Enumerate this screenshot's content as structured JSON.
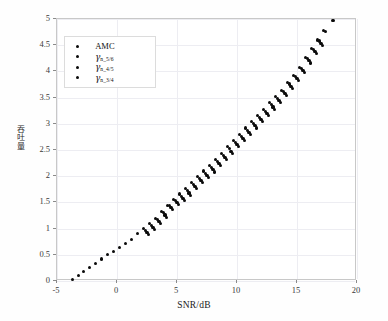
{
  "chart_data": {
    "type": "scatter",
    "title": "",
    "xlabel": "SNR/dB",
    "ylabel": "吞吐量",
    "xlim": [
      -5,
      20
    ],
    "ylim": [
      0,
      5
    ],
    "xticks": [
      -5,
      0,
      5,
      10,
      15,
      20
    ],
    "xtick_labels": [
      "-5",
      "0",
      "5",
      "10",
      "15",
      "20"
    ],
    "yticks": [
      0,
      0.5,
      1,
      1.5,
      2,
      2.5,
      3,
      3.5,
      4,
      4.5,
      5
    ],
    "ytick_labels": [
      "0",
      "0.5",
      "1",
      "1.5",
      "2",
      "2.5",
      "3",
      "3.5",
      "4",
      "4.5",
      "5"
    ],
    "grid": true,
    "legend_position": "upper-left",
    "marker": "circle",
    "marker_color": "#0a0a0a",
    "series": [
      {
        "name": "AMC",
        "label_plain": "AMC",
        "points": [
          [
            -3.7,
            0.02
          ],
          [
            -3.2,
            0.1
          ],
          [
            -2.8,
            0.18
          ],
          [
            -2.3,
            0.26
          ],
          [
            -1.8,
            0.34
          ],
          [
            -1.3,
            0.42
          ],
          [
            -0.8,
            0.5
          ],
          [
            -0.3,
            0.57
          ],
          [
            0.2,
            0.64
          ],
          [
            0.7,
            0.72
          ],
          [
            1.2,
            0.8
          ],
          [
            1.7,
            0.9
          ],
          [
            2.2,
            1.0
          ],
          [
            2.7,
            1.1
          ],
          [
            3.2,
            1.2
          ],
          [
            3.7,
            1.32
          ],
          [
            4.2,
            1.44
          ],
          [
            4.7,
            1.56
          ],
          [
            5.2,
            1.66
          ],
          [
            5.7,
            1.76
          ],
          [
            6.2,
            1.88
          ],
          [
            6.7,
            2.0
          ],
          [
            7.2,
            2.1
          ],
          [
            7.7,
            2.2
          ],
          [
            8.2,
            2.32
          ],
          [
            8.7,
            2.44
          ],
          [
            9.2,
            2.56
          ],
          [
            9.7,
            2.68
          ],
          [
            10.2,
            2.8
          ],
          [
            10.7,
            2.92
          ],
          [
            11.2,
            3.04
          ],
          [
            11.7,
            3.16
          ],
          [
            12.2,
            3.28
          ],
          [
            12.7,
            3.4
          ],
          [
            13.2,
            3.52
          ],
          [
            13.7,
            3.64
          ],
          [
            14.2,
            3.78
          ],
          [
            14.7,
            3.92
          ],
          [
            15.2,
            4.08
          ],
          [
            15.7,
            4.26
          ],
          [
            16.2,
            4.44
          ],
          [
            16.7,
            4.6
          ],
          [
            17.2,
            4.78
          ],
          [
            18.0,
            4.97
          ]
        ]
      },
      {
        "name": "gamma_n_5_6",
        "label_gamma": "γ",
        "label_sub": "n_5/6",
        "points": [
          [
            2.4,
            0.96
          ],
          [
            2.9,
            1.06
          ],
          [
            3.4,
            1.17
          ],
          [
            3.9,
            1.3
          ],
          [
            4.4,
            1.44
          ],
          [
            4.9,
            1.54
          ],
          [
            5.4,
            1.62
          ],
          [
            5.9,
            1.72
          ],
          [
            6.4,
            1.84
          ],
          [
            6.9,
            1.96
          ],
          [
            7.4,
            2.06
          ],
          [
            7.9,
            2.16
          ],
          [
            8.4,
            2.28
          ],
          [
            8.9,
            2.4
          ],
          [
            9.4,
            2.52
          ],
          [
            9.9,
            2.64
          ],
          [
            10.4,
            2.76
          ],
          [
            10.9,
            2.88
          ],
          [
            11.4,
            3.0
          ],
          [
            11.9,
            3.12
          ],
          [
            12.4,
            3.24
          ],
          [
            12.9,
            3.36
          ],
          [
            13.4,
            3.48
          ],
          [
            13.9,
            3.62
          ],
          [
            14.4,
            3.76
          ],
          [
            14.9,
            3.9
          ],
          [
            15.4,
            4.06
          ],
          [
            15.9,
            4.24
          ],
          [
            16.4,
            4.42
          ],
          [
            16.9,
            4.58
          ],
          [
            17.4,
            4.76
          ]
        ]
      },
      {
        "name": "gamma_n_4_5",
        "label_gamma": "γ",
        "label_sub": "n_4/5",
        "points": [
          [
            2.5,
            0.92
          ],
          [
            3.0,
            1.02
          ],
          [
            3.5,
            1.13
          ],
          [
            4.0,
            1.26
          ],
          [
            4.5,
            1.4
          ],
          [
            5.0,
            1.5
          ],
          [
            5.5,
            1.58
          ],
          [
            6.0,
            1.68
          ],
          [
            6.5,
            1.8
          ],
          [
            7.0,
            1.92
          ],
          [
            7.5,
            2.02
          ],
          [
            8.0,
            2.12
          ],
          [
            8.5,
            2.24
          ],
          [
            9.0,
            2.36
          ],
          [
            9.5,
            2.48
          ],
          [
            10.0,
            2.6
          ],
          [
            10.5,
            2.72
          ],
          [
            11.0,
            2.84
          ],
          [
            11.5,
            2.96
          ],
          [
            12.0,
            3.08
          ],
          [
            12.5,
            3.2
          ],
          [
            13.0,
            3.32
          ],
          [
            13.5,
            3.44
          ],
          [
            14.0,
            3.58
          ],
          [
            14.5,
            3.72
          ],
          [
            15.0,
            3.86
          ],
          [
            15.5,
            4.02
          ],
          [
            16.0,
            4.2
          ],
          [
            16.5,
            4.38
          ],
          [
            17.0,
            4.54
          ]
        ]
      },
      {
        "name": "gamma_n_3_4",
        "label_gamma": "γ",
        "label_sub": "n_3/4",
        "points": [
          [
            2.6,
            0.88
          ],
          [
            3.1,
            0.98
          ],
          [
            3.6,
            1.09
          ],
          [
            4.1,
            1.22
          ],
          [
            4.6,
            1.36
          ],
          [
            5.1,
            1.46
          ],
          [
            5.6,
            1.54
          ],
          [
            6.1,
            1.64
          ],
          [
            6.6,
            1.76
          ],
          [
            7.1,
            1.88
          ],
          [
            7.6,
            1.98
          ],
          [
            8.1,
            2.08
          ],
          [
            8.6,
            2.2
          ],
          [
            9.1,
            2.32
          ],
          [
            9.6,
            2.44
          ],
          [
            10.1,
            2.56
          ],
          [
            10.6,
            2.68
          ],
          [
            11.1,
            2.8
          ],
          [
            11.6,
            2.92
          ],
          [
            12.1,
            3.04
          ],
          [
            12.6,
            3.16
          ],
          [
            13.1,
            3.28
          ],
          [
            13.6,
            3.4
          ],
          [
            14.1,
            3.54
          ],
          [
            14.6,
            3.68
          ],
          [
            15.1,
            3.82
          ],
          [
            15.6,
            3.98
          ],
          [
            16.1,
            4.16
          ],
          [
            16.6,
            4.34
          ],
          [
            17.1,
            4.5
          ]
        ]
      }
    ]
  },
  "legend": {
    "entries": [
      {
        "text": "AMC",
        "gamma": "",
        "sub": ""
      },
      {
        "text": "",
        "gamma": "γ",
        "sub": "n_5/6"
      },
      {
        "text": "",
        "gamma": "γ",
        "sub": "n_4/5"
      },
      {
        "text": "",
        "gamma": "γ",
        "sub": "n_3/4"
      }
    ]
  },
  "axis": {
    "xlabel": "SNR/dB",
    "ylabel": "吞吐量"
  }
}
